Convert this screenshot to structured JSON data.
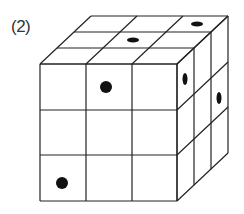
{
  "label": "(2)",
  "colors": {
    "line": "#222222",
    "dot": "#111111",
    "background": "#ffffff"
  },
  "cube": {
    "grid": "3x3x3",
    "front_face": {
      "x": [
        40,
        86,
        132,
        177
      ],
      "y": [
        64,
        110,
        155,
        201
      ]
    },
    "depth_offset": {
      "dx": 51,
      "dy": -48
    },
    "dots": [
      {
        "face": "top",
        "cx": 197,
        "cy": 24,
        "rx": 6,
        "ry": 2.5
      },
      {
        "face": "top",
        "cx": 133,
        "cy": 40,
        "rx": 6,
        "ry": 2.5
      },
      {
        "face": "front",
        "cx": 106,
        "cy": 87,
        "rx": 6,
        "ry": 6
      },
      {
        "face": "front",
        "cx": 62,
        "cy": 183,
        "rx": 6,
        "ry": 6
      },
      {
        "face": "right",
        "cx": 185,
        "cy": 79,
        "rx": 2.5,
        "ry": 6
      },
      {
        "face": "right",
        "cx": 219,
        "cy": 98,
        "rx": 2.5,
        "ry": 6
      }
    ]
  }
}
